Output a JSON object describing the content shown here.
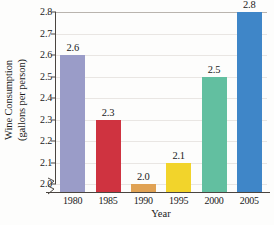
{
  "chart_data": {
    "type": "bar",
    "title": "",
    "xlabel": "Year",
    "ylabel": "Wine Consumption (gallons per person)",
    "ylabel_line1": "Wine Consumption",
    "ylabel_line2": "(gallons per person)",
    "categories": [
      "1980",
      "1985",
      "1990",
      "1995",
      "2000",
      "2005"
    ],
    "values": [
      2.6,
      2.3,
      2.0,
      2.1,
      2.5,
      2.8
    ],
    "value_labels": [
      "2.6",
      "2.3",
      "2.0",
      "2.1",
      "2.5",
      "2.8"
    ],
    "ylim": [
      2.0,
      2.8
    ],
    "y_axis_broken": true,
    "ytick_labels": [
      "2.8",
      "2.7",
      "2.6",
      "2.5",
      "2.4",
      "2.3",
      "2.2",
      "2.1",
      "2.0"
    ],
    "ytick_values": [
      2.8,
      2.7,
      2.6,
      2.5,
      2.4,
      2.3,
      2.2,
      2.1,
      2.0
    ],
    "grid": true,
    "legend": "none",
    "bar_colors": [
      "#9a9cc8",
      "#cf3340",
      "#e0a254",
      "#f2d42b",
      "#62bfa0",
      "#3f86c8"
    ],
    "series": [
      {
        "name": "Wine Consumption",
        "values": [
          2.6,
          2.3,
          2.0,
          2.1,
          2.5,
          2.8
        ]
      }
    ]
  },
  "colors": {
    "axis": "#4a4540",
    "grid": "#e9e6e3",
    "text": "#1a1a1a",
    "background": "#fdfdfc"
  }
}
